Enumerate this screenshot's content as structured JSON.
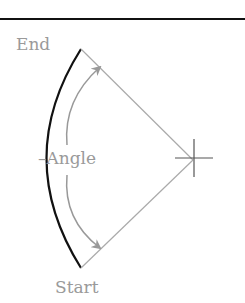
{
  "diagram": {
    "labels": {
      "end": "End",
      "start": "Start",
      "angle": "–Angle"
    },
    "colors": {
      "arc": "#111111",
      "radius_lines": "#aaaaaa",
      "arrows": "#999999",
      "text": "#9a9a9a",
      "top_rule": "#111111"
    }
  }
}
